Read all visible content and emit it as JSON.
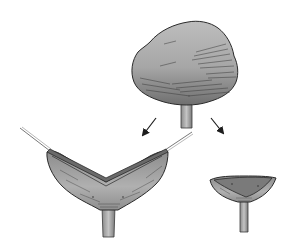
{
  "figure": {
    "colors": {
      "background": "#ffffff",
      "fill_light": "#b8b8b8",
      "fill_mid": "#9a9a9a",
      "fill_dark": "#6e6e6e",
      "outline": "#2a2a2a",
      "arrow": "#1e1e1e"
    },
    "elements": [
      {
        "name": "rounded-cap",
        "label": ""
      },
      {
        "name": "arrow-left",
        "direction": "down-left"
      },
      {
        "name": "arrow-right",
        "direction": "down-right"
      },
      {
        "name": "v-shaped-cup",
        "label": ""
      },
      {
        "name": "small-cup",
        "label": ""
      }
    ]
  }
}
